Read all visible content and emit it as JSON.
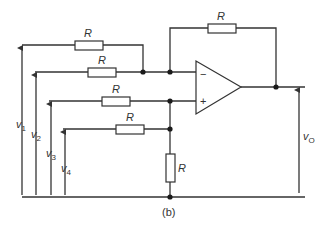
{
  "figure": {
    "caption": "(b)",
    "type": "summing amplifier circuit (op-amp)"
  },
  "resistors": {
    "r_input_1": "R",
    "r_input_2": "R",
    "r_input_3": "R",
    "r_input_4": "R",
    "r_feedback": "R",
    "r_ground": "R"
  },
  "opamp": {
    "inverting": "−",
    "noninverting": "+"
  },
  "voltages": {
    "v1": {
      "base": "v",
      "sub": "1"
    },
    "v2": {
      "base": "v",
      "sub": "2"
    },
    "v3": {
      "base": "v",
      "sub": "3"
    },
    "v4": {
      "base": "v",
      "sub": "4"
    },
    "vo": {
      "base": "v",
      "sub": "O"
    }
  },
  "colors": {
    "line": "#333333",
    "background": "#ffffff"
  }
}
